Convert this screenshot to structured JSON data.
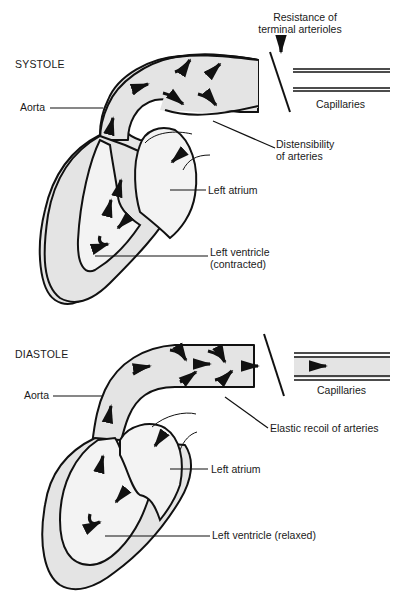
{
  "systole": {
    "title": "SYSTOLE",
    "labels": {
      "aorta": "Aorta",
      "resistance_line1": "Resistance of",
      "resistance_line2": "terminal arterioles",
      "capillaries": "Capillaries",
      "distensibility_line1": "Distensibility",
      "distensibility_line2": "of arteries",
      "left_atrium": "Left atrium",
      "left_ventricle_line1": "Left ventricle",
      "left_ventricle_line2": "(contracted)"
    }
  },
  "diastole": {
    "title": "DIASTOLE",
    "labels": {
      "aorta": "Aorta",
      "capillaries": "Capillaries",
      "elastic_recoil": "Elastic recoil of arteries",
      "left_atrium": "Left atrium",
      "left_ventricle": "Left ventricle (relaxed)"
    }
  },
  "colors": {
    "tissue": "#e4e4e4",
    "chamber": "#f3f3f3",
    "ink": "#111111"
  }
}
